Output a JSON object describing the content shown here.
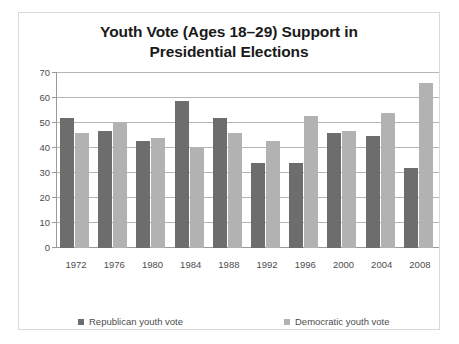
{
  "chart_data": {
    "type": "bar",
    "title": "Youth Vote (Ages 18–29) Support in Presidential Elections",
    "title_line1": "Youth Vote (Ages 18–29) Support in",
    "title_line2": "Presidential Elections",
    "xlabel": "",
    "ylabel": "",
    "ylim": [
      0,
      70
    ],
    "yticks": [
      0,
      10,
      20,
      30,
      40,
      50,
      60,
      70
    ],
    "grid": true,
    "legend_position": "bottom",
    "categories": [
      "1972",
      "1976",
      "1980",
      "1984",
      "1988",
      "1992",
      "1996",
      "2000",
      "2004",
      "2008"
    ],
    "series": [
      {
        "name": "Republican youth vote",
        "color": "#6d6d6d",
        "values": [
          52,
          47,
          43,
          59,
          52,
          34,
          34,
          46,
          45,
          32
        ]
      },
      {
        "name": "Democratic youth vote",
        "color": "#b2b2b2",
        "values": [
          46,
          50,
          44,
          40,
          46,
          43,
          53,
          47,
          54,
          66
        ]
      }
    ]
  },
  "legend": {
    "items": [
      {
        "label": "Republican youth vote"
      },
      {
        "label": "Democratic youth vote"
      }
    ]
  }
}
